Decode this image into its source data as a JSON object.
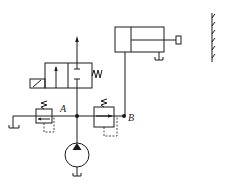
{
  "diagram": {
    "type": "hydraulic-circuit",
    "labels": {
      "node_a": "A",
      "node_b": "B"
    },
    "components": [
      {
        "name": "hydraulic-pump",
        "symbol": "fixed-displacement-pump"
      },
      {
        "name": "relief-valve-left",
        "symbol": "pressure-relief-valve"
      },
      {
        "name": "relief-valve-right",
        "symbol": "pressure-relief-valve"
      },
      {
        "name": "directional-valve",
        "symbol": "2-position-solenoid-valve-spring-return"
      },
      {
        "name": "hydraulic-cylinder",
        "symbol": "single-rod-cylinder"
      },
      {
        "name": "fixed-wall",
        "symbol": "hatched-wall"
      },
      {
        "name": "tank",
        "symbol": "reservoir"
      }
    ],
    "colors": {
      "line": "#1a1a1a",
      "background": "#ffffff"
    }
  }
}
